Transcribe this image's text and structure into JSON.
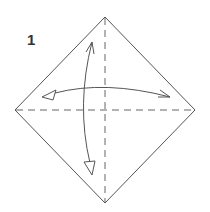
{
  "diagram": {
    "step_number": "1",
    "colors": {
      "line": "#555555",
      "background": "#ffffff"
    },
    "elements": [
      "diamond-paper",
      "vertical-valley-fold-line",
      "horizontal-valley-fold-line",
      "horizontal-fold-unfold-arrow",
      "vertical-fold-unfold-arrow"
    ]
  }
}
